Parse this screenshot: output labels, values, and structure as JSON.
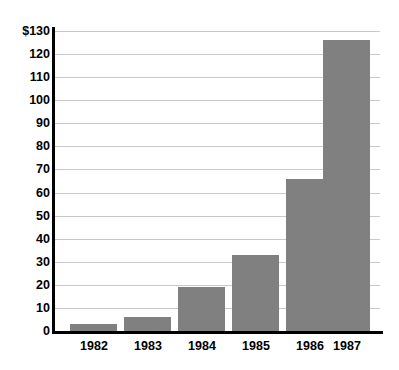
{
  "chart_data": {
    "type": "bar",
    "title": "",
    "subtitle": "",
    "xlabel": "",
    "ylabel": "",
    "categories": [
      "1982",
      "1983",
      "1984",
      "1985",
      "1986",
      "1987"
    ],
    "values": [
      3,
      6,
      19,
      33,
      66,
      126
    ],
    "ylim": [
      0,
      130
    ],
    "ytick_values": [
      0,
      10,
      20,
      30,
      40,
      50,
      60,
      70,
      80,
      90,
      100,
      110,
      120,
      130
    ],
    "ytick_labels": [
      "0",
      "10",
      "20",
      "30",
      "40",
      "50",
      "60",
      "70",
      "80",
      "90",
      "100",
      "110",
      "120",
      "$130"
    ],
    "grid": true,
    "grid_axis": "y",
    "legend": false,
    "legend_position": "none",
    "bar_color": "#808080",
    "axis_color": "#000000",
    "gridline_color": "#c9c9c9",
    "background_color": "#ffffff"
  }
}
